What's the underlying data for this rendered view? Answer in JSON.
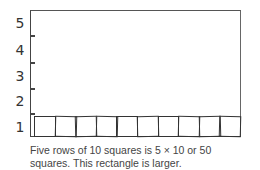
{
  "diagram": {
    "y_axis_labels": [
      "5",
      "4",
      "3",
      "2",
      "1"
    ],
    "rows_total": 5,
    "squares_per_row": 10,
    "rows_filled": 1,
    "caption_line1": "Five rows of 10 squares is 5 × 10 or 50",
    "caption_line2": "squares. This rectangle is larger."
  }
}
